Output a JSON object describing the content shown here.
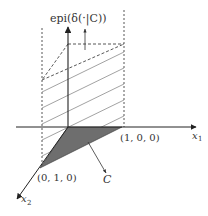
{
  "figure": {
    "epi_label": "epi(δ(·|C))",
    "x1_label": "x",
    "x1_sub": "1",
    "x2_label": "x",
    "x2_sub": "2",
    "point_100": "(1, 0, 0)",
    "point_010": "(0, 1, 0)",
    "set_label": "C",
    "colors": {
      "axis": "#222222",
      "dashed": "#444444",
      "hatch": "#777777",
      "fill": "#6e6e6e"
    }
  }
}
